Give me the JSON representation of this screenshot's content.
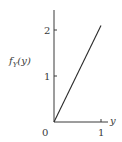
{
  "chart_data": {
    "type": "line",
    "title": "",
    "xlabel": "y",
    "ylabel": "f_Y(y)",
    "ylabel_display": {
      "base": "f",
      "sub": "Y",
      "arg": "(y)"
    },
    "x": [
      0,
      1
    ],
    "series": [
      {
        "name": "f_Y(y) = 2.1y",
        "values": [
          0,
          2.1
        ]
      }
    ],
    "xlim": [
      0,
      1
    ],
    "ylim": [
      0,
      2.4
    ],
    "x_ticks": [
      "0",
      "1"
    ],
    "y_ticks": [
      "1",
      "2"
    ],
    "grid": false,
    "legend": null,
    "colors": {
      "axis": "#3a3a3a",
      "line": "#2a2a2a",
      "background": "#ffffff"
    }
  },
  "labels": {
    "origin": "0",
    "x_tick_1": "1",
    "y_tick_1": "1",
    "y_tick_2": "2",
    "x_axis": "y",
    "y_axis_base": "f",
    "y_axis_sub": "Y",
    "y_axis_arg": "(y)"
  }
}
